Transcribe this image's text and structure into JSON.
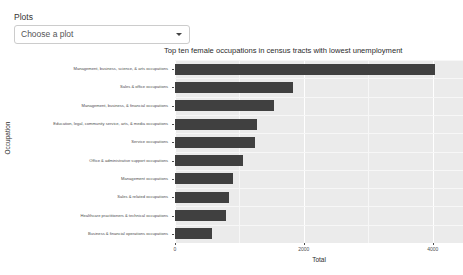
{
  "select": {
    "label": "Plots",
    "value": "Choose a plot",
    "caret_icon": "chevron-down-icon"
  },
  "chart_data": {
    "type": "bar",
    "orientation": "horizontal",
    "title": "Top ten female occupations in census tracts with lowest unemployment",
    "xlabel": "Total",
    "ylabel": "Occupation",
    "xlim": [
      0,
      4470
    ],
    "xticks": [
      0,
      2000,
      4000
    ],
    "xticklabels": [
      "0",
      "2000",
      "4000"
    ],
    "grid": true,
    "legend": "none",
    "bar_color": "#404040",
    "panel_color": "#ebebeb",
    "gridline_color": "#ffffff",
    "categories": [
      "Management, business, science, & arts occupations",
      "Sales & office occupations",
      "Management, business, & financial occupations",
      "Education, legal, community service, arts, & media occupations",
      "Service occupations",
      "Office & administrative support occupations",
      "Management occupations",
      "Sales & related occupations",
      "Healthcare practitioners & technical occupations",
      "Business & financial operations occupations"
    ],
    "values": [
      4040,
      1830,
      1530,
      1270,
      1240,
      1060,
      900,
      840,
      790,
      580
    ]
  }
}
